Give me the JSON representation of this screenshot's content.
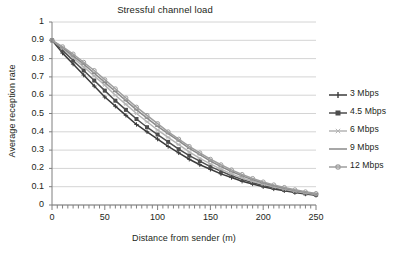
{
  "chart_data": {
    "type": "line",
    "title": "Stressful channel load",
    "xlabel": "Distance from sender (m)",
    "ylabel": "Average reception rate",
    "xlim": [
      0,
      250
    ],
    "ylim": [
      0,
      1
    ],
    "xticks": [
      "0",
      "50",
      "100",
      "150",
      "200",
      "250"
    ],
    "yticks": [
      "0",
      "0.1",
      "0.2",
      "0.3",
      "0.4",
      "0.5",
      "0.6",
      "0.7",
      "0.8",
      "0.9",
      "1"
    ],
    "grid": "horizontal",
    "legend_position": "right",
    "x": [
      0,
      10,
      20,
      30,
      40,
      50,
      60,
      70,
      80,
      90,
      100,
      110,
      120,
      130,
      140,
      150,
      160,
      170,
      180,
      190,
      200,
      210,
      220,
      230,
      240,
      250
    ],
    "series": [
      {
        "name": "3 Mbps",
        "color": "#3b3b3b",
        "marker": "cross",
        "values": [
          0.9,
          0.83,
          0.77,
          0.71,
          0.65,
          0.59,
          0.54,
          0.49,
          0.44,
          0.4,
          0.36,
          0.32,
          0.285,
          0.25,
          0.22,
          0.195,
          0.17,
          0.15,
          0.13,
          0.115,
          0.1,
          0.088,
          0.078,
          0.068,
          0.06,
          0.053
        ]
      },
      {
        "name": "4.5 Mbps",
        "color": "#4d4d4d",
        "marker": "square",
        "values": [
          0.9,
          0.845,
          0.79,
          0.735,
          0.68,
          0.625,
          0.57,
          0.52,
          0.47,
          0.425,
          0.385,
          0.345,
          0.305,
          0.27,
          0.24,
          0.21,
          0.185,
          0.16,
          0.14,
          0.122,
          0.107,
          0.094,
          0.082,
          0.072,
          0.063,
          0.056
        ]
      },
      {
        "name": "6 Mbps",
        "color": "#b5b5b5",
        "marker": "star",
        "values": [
          0.9,
          0.855,
          0.805,
          0.755,
          0.705,
          0.655,
          0.6,
          0.55,
          0.5,
          0.455,
          0.41,
          0.37,
          0.33,
          0.29,
          0.255,
          0.225,
          0.195,
          0.17,
          0.148,
          0.13,
          0.113,
          0.099,
          0.086,
          0.075,
          0.065,
          0.057
        ]
      },
      {
        "name": "9 Mbps",
        "color": "#8a8a8a",
        "marker": "line",
        "values": [
          0.9,
          0.86,
          0.815,
          0.77,
          0.72,
          0.67,
          0.62,
          0.57,
          0.52,
          0.475,
          0.43,
          0.39,
          0.35,
          0.31,
          0.275,
          0.24,
          0.21,
          0.183,
          0.159,
          0.138,
          0.12,
          0.105,
          0.091,
          0.079,
          0.069,
          0.06
        ]
      },
      {
        "name": "12 Mbps",
        "color": "#9e9e9e",
        "marker": "circle",
        "values": [
          0.9,
          0.865,
          0.825,
          0.78,
          0.735,
          0.685,
          0.635,
          0.585,
          0.535,
          0.49,
          0.445,
          0.4,
          0.36,
          0.32,
          0.285,
          0.25,
          0.22,
          0.192,
          0.167,
          0.145,
          0.126,
          0.11,
          0.096,
          0.083,
          0.072,
          0.063
        ]
      }
    ]
  }
}
